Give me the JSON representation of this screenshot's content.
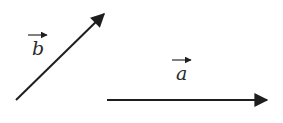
{
  "diagram": {
    "title": "",
    "vectors": [
      {
        "id": "b",
        "label": "b",
        "start": [
          16,
          100
        ],
        "end": [
          106,
          12
        ],
        "label_pos": [
          33,
          55
        ],
        "label_arrow": [
          28,
          35,
          47,
          35
        ]
      },
      {
        "id": "a",
        "label": "a",
        "start": [
          107,
          100
        ],
        "end": [
          269,
          100
        ],
        "label_pos": [
          177,
          80
        ],
        "label_arrow": [
          172,
          60,
          191,
          60
        ]
      }
    ],
    "colors": {
      "stroke": "#1e1e1e",
      "background": "#ffffff"
    }
  }
}
